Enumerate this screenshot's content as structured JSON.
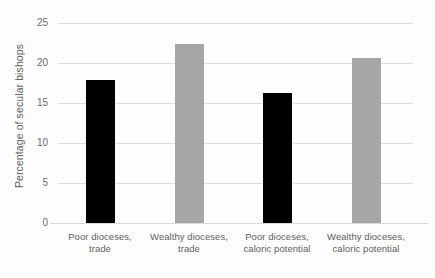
{
  "chart_data": {
    "type": "bar",
    "title": "",
    "xlabel": "",
    "ylabel": "Percentage of secular bishops",
    "ylim": [
      0,
      25
    ],
    "yticks": [
      "0",
      "5",
      "10",
      "15",
      "20",
      "25"
    ],
    "ytick_values": [
      0,
      5,
      10,
      15,
      20,
      25
    ],
    "grid": "horizontal",
    "legend": "none",
    "categories": [
      "Poor dioceses, trade",
      "Wealthy dioceses, trade",
      "Poor dioceses, caloric potential",
      "Wealthy dioceses, caloric potential"
    ],
    "values": [
      17.9,
      22.4,
      16.3,
      20.6
    ],
    "bar_colors": [
      "#000000",
      "#a6a6a6",
      "#000000",
      "#a6a6a6"
    ]
  },
  "colors": {
    "dark_bar": "#000000",
    "light_bar": "#a6a6a6",
    "gridline": "#dedede",
    "axis_text": "#5d5d5d",
    "background": "#fdfdfd"
  }
}
